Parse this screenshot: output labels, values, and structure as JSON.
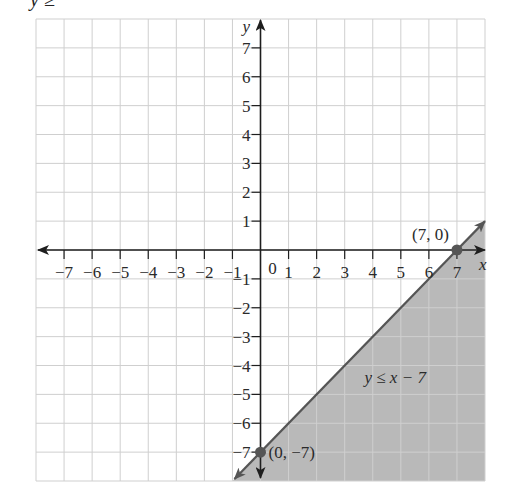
{
  "caption_fragment": "y ≥",
  "chart_data": {
    "type": "line",
    "title": "",
    "xlabel": "x",
    "ylabel": "y",
    "xlim": [
      -8,
      8
    ],
    "ylim": [
      -8,
      8
    ],
    "grid": true,
    "x_ticks": [
      -7,
      -6,
      -5,
      -4,
      -3,
      -2,
      -1,
      1,
      2,
      3,
      4,
      5,
      6,
      7
    ],
    "y_ticks": [
      -7,
      -6,
      -5,
      -4,
      -3,
      -2,
      -1,
      1,
      2,
      3,
      4,
      5,
      6,
      7
    ],
    "x_tick_labels": [
      "−7",
      "−6",
      "−5",
      "−4",
      "−3",
      "−2",
      "−1",
      "1",
      "2",
      "3",
      "4",
      "5",
      "6",
      "7"
    ],
    "y_tick_labels": [
      "−7",
      "−6",
      "−5",
      "−4",
      "−3",
      "−2",
      "−1",
      "1",
      "2",
      "3",
      "4",
      "5",
      "6",
      "7"
    ],
    "origin_label": "0",
    "boundary_line": {
      "equation": "y = x − 7",
      "slope": 1,
      "intercept": -7,
      "style": "solid",
      "x_range": [
        -1,
        8
      ]
    },
    "shaded_region": {
      "inequality": "y ≤ x − 7",
      "side": "below-right"
    },
    "points": [
      {
        "x": 7,
        "y": 0,
        "label": "(7, 0)"
      },
      {
        "x": 0,
        "y": -7,
        "label": "(0, −7)"
      }
    ],
    "annotations": [
      {
        "text": "y ≤ x − 7",
        "x": 4.8,
        "y": -4.6
      }
    ],
    "colors": {
      "shade": "#b9b9b9",
      "line": "#555555",
      "grid": "#cfcfcf",
      "axis": "#1e1e1e",
      "point": "#555555"
    }
  }
}
